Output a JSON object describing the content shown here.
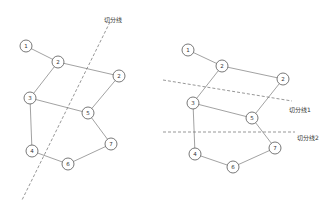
{
  "left_graph": {
    "cut_label": "切分线",
    "nodes": [
      {
        "id": "n1",
        "label": "1",
        "x": 26,
        "y": 46
      },
      {
        "id": "n2a",
        "label": "2",
        "x": 58,
        "y": 62
      },
      {
        "id": "n2b",
        "label": "2",
        "x": 119,
        "y": 76
      },
      {
        "id": "n3",
        "label": "3",
        "x": 30,
        "y": 98
      },
      {
        "id": "n5",
        "label": "5",
        "x": 88,
        "y": 113
      },
      {
        "id": "n7",
        "label": "7",
        "x": 111,
        "y": 144
      },
      {
        "id": "n4",
        "label": "4",
        "x": 32,
        "y": 151
      },
      {
        "id": "n6",
        "label": "6",
        "x": 68,
        "y": 164
      }
    ]
  },
  "right_graph": {
    "cut_label_1": "切分线1",
    "cut_label_2": "切分线2",
    "nodes": [
      {
        "id": "n1",
        "label": "1",
        "x": 188,
        "y": 50
      },
      {
        "id": "n2a",
        "label": "2",
        "x": 222,
        "y": 66
      },
      {
        "id": "n2b",
        "label": "2",
        "x": 283,
        "y": 79
      },
      {
        "id": "n3",
        "label": "3",
        "x": 193,
        "y": 103
      },
      {
        "id": "n5",
        "label": "5",
        "x": 252,
        "y": 118
      },
      {
        "id": "n7",
        "label": "7",
        "x": 275,
        "y": 148
      },
      {
        "id": "n4",
        "label": "4",
        "x": 195,
        "y": 154
      },
      {
        "id": "n6",
        "label": "6",
        "x": 233,
        "y": 167
      }
    ]
  }
}
